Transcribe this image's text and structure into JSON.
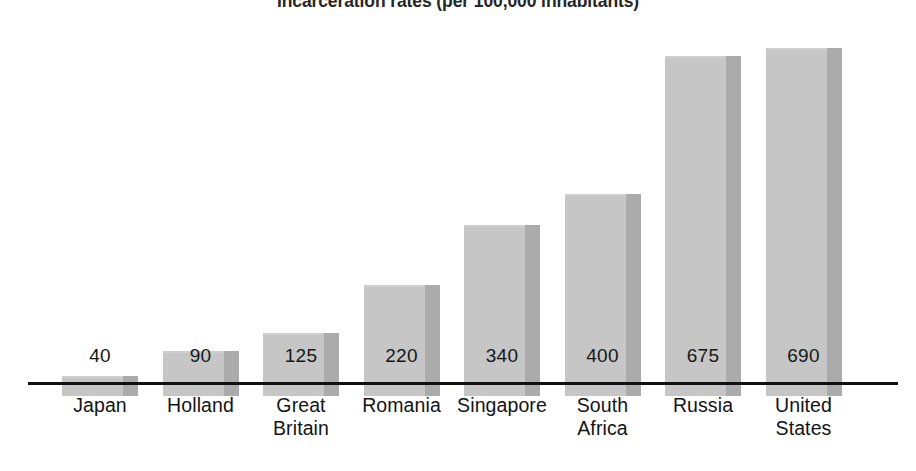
{
  "chart_data": {
    "type": "bar",
    "title": "Incarceration rates (per 100,000 inhabitants)",
    "xlabel": "",
    "ylabel": "",
    "ylim": [
      0,
      700
    ],
    "grid": false,
    "legend": "none",
    "axis": "single horizontal baseline, no y-axis, no tick marks",
    "value_labels_position": "above or inside bar, aligned on a common row",
    "categories": [
      "Japan",
      "Holland",
      "Great Britain",
      "Romania",
      "Singapore",
      "South Africa",
      "Russia",
      "United States"
    ],
    "category_lines": [
      [
        "Japan"
      ],
      [
        "Holland"
      ],
      [
        "Great",
        "Britain"
      ],
      [
        "Romania"
      ],
      [
        "Singapore"
      ],
      [
        "South",
        "Africa"
      ],
      [
        "Russia"
      ],
      [
        "United",
        "States"
      ]
    ],
    "values": [
      40,
      90,
      125,
      220,
      340,
      400,
      675,
      690
    ],
    "value_labels": [
      "40",
      "90",
      "125",
      "220",
      "340",
      "400",
      "675",
      "690"
    ],
    "colors": {
      "bar_face": "#c6c6c6",
      "bar_side": "#ababab",
      "axis": "#111111",
      "text": "#141414",
      "background": "#ffffff"
    }
  }
}
